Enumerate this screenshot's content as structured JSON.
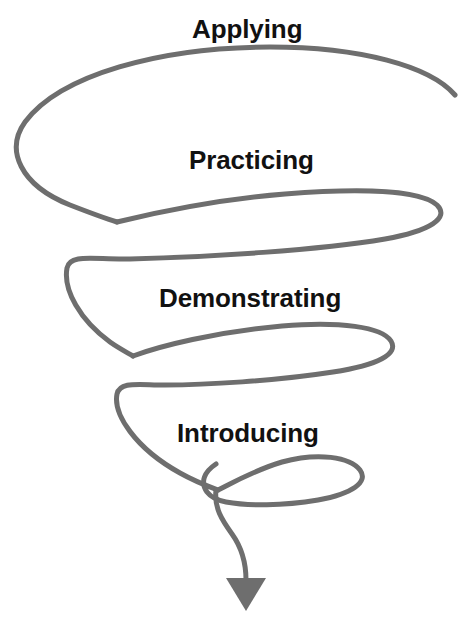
{
  "diagram": {
    "type": "spiral-arrow",
    "background_color": "#ffffff",
    "stroke_color": "#6e6e6e",
    "text_color": "#111111",
    "stroke_width": 5,
    "arrow": {
      "name": "downward-arrowhead",
      "direction": "down",
      "color": "#6e6e6e"
    },
    "stages": [
      {
        "id": "applying",
        "label": "Applying",
        "order": 1,
        "loop": 1
      },
      {
        "id": "practicing",
        "label": "Practicing",
        "order": 2,
        "loop": 2
      },
      {
        "id": "demonstrating",
        "label": "Demonstrating",
        "order": 3,
        "loop": 3
      },
      {
        "id": "introducing",
        "label": "Introducing",
        "order": 4,
        "loop": 4
      }
    ]
  }
}
